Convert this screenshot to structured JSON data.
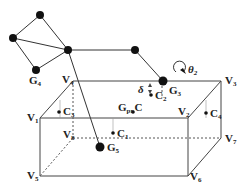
{
  "diagram": {
    "graph_nodes": [
      {
        "id": "n_top",
        "label": ""
      },
      {
        "id": "n_left",
        "label": ""
      },
      {
        "id": "G4",
        "label": "G",
        "sub": "4"
      },
      {
        "id": "n_hub",
        "label": ""
      },
      {
        "id": "n_right",
        "label": ""
      },
      {
        "id": "G3",
        "label": "G",
        "sub": "3"
      },
      {
        "id": "G5",
        "label": "G",
        "sub": "5"
      }
    ],
    "graph_edges": [
      [
        "n_top",
        "n_left"
      ],
      [
        "n_top",
        "n_hub"
      ],
      [
        "n_left",
        "n_hub"
      ],
      [
        "n_left",
        "G4"
      ],
      [
        "G4",
        "n_hub"
      ],
      [
        "n_hub",
        "n_right"
      ],
      [
        "n_right",
        "G3"
      ],
      [
        "n_hub",
        "G5"
      ]
    ],
    "box_vertices": {
      "V1": "V",
      "V2": "V",
      "V3": "V",
      "V4": "V",
      "V5": "V",
      "V6": "V",
      "V7": "V",
      "V8": "V"
    },
    "vertex_subs": {
      "V1": "1",
      "V2": "2",
      "V3": "3",
      "V4": "4",
      "V5": "5",
      "V6": "6",
      "V7": "7",
      "V8": "8"
    },
    "points": {
      "C1": {
        "label": "C",
        "sub": "1"
      },
      "C2": {
        "label": "C",
        "sub": "2"
      },
      "C3": {
        "label": "C",
        "sub": "3"
      },
      "C4": {
        "label": "C",
        "sub": "4"
      },
      "Gpr_C": {
        "label": "G",
        "sub": "pr",
        "suffix": "C"
      }
    },
    "annotations": {
      "theta": {
        "label": "θ",
        "sub": "2"
      },
      "delta": {
        "label": "δ"
      }
    }
  }
}
